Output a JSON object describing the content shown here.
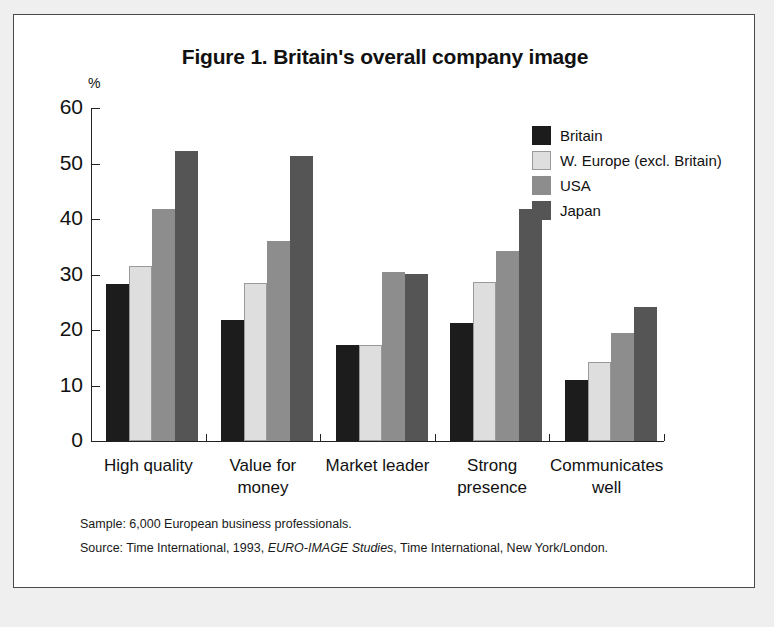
{
  "figure": {
    "title": "Figure 1. Britain's overall company image",
    "axis_unit": "%",
    "footnote_sample": "Sample: 6,000 European business professionals.",
    "footnote_source_pre": "Source: Time International, 1993, ",
    "footnote_source_italic": "EURO-IMAGE Studies",
    "footnote_source_post": ", Time International, New York/London."
  },
  "legend": {
    "items": [
      {
        "label": "Britain",
        "color": "#1c1c1c"
      },
      {
        "label": "W. Europe (excl. Britain)",
        "color": "#dedede"
      },
      {
        "label": "USA",
        "color": "#8d8d8d"
      },
      {
        "label": "Japan",
        "color": "#555555"
      }
    ]
  },
  "axis": {
    "y_ticks": [
      "60",
      "50",
      "40",
      "30",
      "20",
      "10",
      "0"
    ]
  },
  "categories_display": [
    {
      "line1": "High quality",
      "line2": ""
    },
    {
      "line1": "Value for",
      "line2": "money"
    },
    {
      "line1": "Market leader",
      "line2": ""
    },
    {
      "line1": "Strong",
      "line2": "presence"
    },
    {
      "line1": "Communicates",
      "line2": "well"
    }
  ],
  "chart_data": {
    "type": "bar",
    "title": "Figure 1. Britain's overall company image",
    "xlabel": "",
    "ylabel": "%",
    "ylim": [
      0,
      60
    ],
    "ytick_interval": 10,
    "grid": false,
    "legend_position": "top-right",
    "categories": [
      "High quality",
      "Value for money",
      "Market leader",
      "Strong presence",
      "Communicates well"
    ],
    "series": [
      {
        "name": "Britain",
        "color": "#1c1c1c",
        "values": [
          28.3,
          21.8,
          17.3,
          21.2,
          11.0
        ]
      },
      {
        "name": "W. Europe (excl. Britain)",
        "color": "#dedede",
        "values": [
          31.6,
          28.4,
          17.3,
          28.7,
          14.3
        ]
      },
      {
        "name": "USA",
        "color": "#8d8d8d",
        "values": [
          41.8,
          36.1,
          30.5,
          34.3,
          19.5
        ]
      },
      {
        "name": "Japan",
        "color": "#555555",
        "values": [
          52.2,
          51.4,
          30.1,
          41.8,
          24.2
        ]
      }
    ],
    "annotations": [
      "Sample: 6,000 European business professionals.",
      "Source: Time International, 1993, EURO-IMAGE Studies, Time International, New York/London."
    ]
  }
}
